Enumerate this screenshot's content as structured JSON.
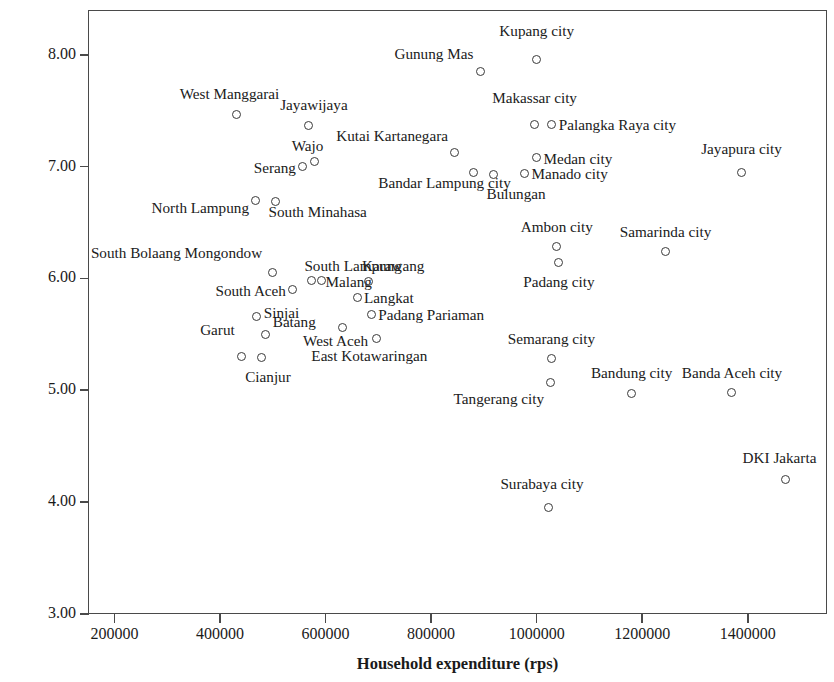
{
  "chart_data": {
    "type": "scatter",
    "title": "",
    "xlabel": "Household expenditure (rps)",
    "ylabel": "Clientelism perception index",
    "xlim": [
      150000,
      1550000
    ],
    "ylim": [
      3.0,
      8.4
    ],
    "xticks": [
      "200000",
      "400000",
      "600000",
      "800000",
      "1000000",
      "1200000",
      "1400000"
    ],
    "xtick_values": [
      200000,
      400000,
      600000,
      800000,
      1000000,
      1200000,
      1400000
    ],
    "yticks": [
      "3.00",
      "4.00",
      "5.00",
      "6.00",
      "7.00",
      "8.00"
    ],
    "ytick_values": [
      3.0,
      4.0,
      5.0,
      6.0,
      7.0,
      8.0
    ],
    "grid": false,
    "legend": "none",
    "marker": "open-circle",
    "points": [
      {
        "label": "Kupang city",
        "x": 1000000,
        "y": 7.96,
        "lx": 1000000,
        "ly": 8.22,
        "anchor": "mid"
      },
      {
        "label": "Gunung Mas",
        "x": 893000,
        "y": 7.85,
        "lx": 880000,
        "ly": 8.02,
        "anchor": "end"
      },
      {
        "label": "Makassar city",
        "x": 996000,
        "y": 7.38,
        "lx": 996000,
        "ly": 7.62,
        "anchor": "mid"
      },
      {
        "label": "Palangka Raya city",
        "x": 1029000,
        "y": 7.38,
        "lx": 1042000,
        "ly": 7.38,
        "anchor": "start"
      },
      {
        "label": "West Manggarai",
        "x": 431000,
        "y": 7.47,
        "lx": 418000,
        "ly": 7.66,
        "anchor": "mid"
      },
      {
        "label": "Jayawijaya",
        "x": 567000,
        "y": 7.37,
        "lx": 578000,
        "ly": 7.56,
        "anchor": "mid"
      },
      {
        "label": "Kutai Kartanegara",
        "x": 845000,
        "y": 7.13,
        "lx": 832000,
        "ly": 7.28,
        "anchor": "end"
      },
      {
        "label": "Wajo",
        "x": 579000,
        "y": 7.05,
        "lx": 566000,
        "ly": 7.19,
        "anchor": "mid"
      },
      {
        "label": "Serang",
        "x": 557000,
        "y": 7.0,
        "lx": 544000,
        "ly": 7.0,
        "anchor": "end"
      },
      {
        "label": "Medan city",
        "x": 1000000,
        "y": 7.08,
        "lx": 1013000,
        "ly": 7.08,
        "anchor": "start"
      },
      {
        "label": "Jayapura city",
        "x": 1388000,
        "y": 6.95,
        "lx": 1388000,
        "ly": 7.17,
        "anchor": "mid"
      },
      {
        "label": "Bandar Lampung city",
        "x": 881000,
        "y": 6.95,
        "lx": 700000,
        "ly": 6.86,
        "anchor": "start"
      },
      {
        "label": "Manado city",
        "x": 977000,
        "y": 6.94,
        "lx": 990000,
        "ly": 6.94,
        "anchor": "start"
      },
      {
        "label": "Bulungan",
        "x": 918000,
        "y": 6.93,
        "lx": 905000,
        "ly": 6.76,
        "anchor": "start"
      },
      {
        "label": "North Lampung",
        "x": 468000,
        "y": 6.7,
        "lx": 455000,
        "ly": 6.64,
        "anchor": "end"
      },
      {
        "label": "South Minahasa",
        "x": 505000,
        "y": 6.69,
        "lx": 492000,
        "ly": 6.6,
        "anchor": "start"
      },
      {
        "label": "Ambon city",
        "x": 1038000,
        "y": 6.29,
        "lx": 1038000,
        "ly": 6.47,
        "anchor": "mid"
      },
      {
        "label": "Samarinda city",
        "x": 1244000,
        "y": 6.24,
        "lx": 1244000,
        "ly": 6.42,
        "anchor": "mid"
      },
      {
        "label": "Padang city",
        "x": 1042000,
        "y": 6.14,
        "lx": 1042000,
        "ly": 5.98,
        "anchor": "mid"
      },
      {
        "label": "South Bolaang Mongondow",
        "x": 500000,
        "y": 6.05,
        "lx": 480000,
        "ly": 6.24,
        "anchor": "end"
      },
      {
        "label": "South Lampung",
        "x": 573000,
        "y": 5.98,
        "lx": 560000,
        "ly": 6.12,
        "anchor": "start"
      },
      {
        "label": "Karawang",
        "x": 682000,
        "y": 5.97,
        "lx": 669000,
        "ly": 6.12,
        "anchor": "start"
      },
      {
        "label": "Malang",
        "x": 592000,
        "y": 5.98,
        "lx": 600000,
        "ly": 5.98,
        "anchor": "start"
      },
      {
        "label": "South Aceh",
        "x": 538000,
        "y": 5.9,
        "lx": 525000,
        "ly": 5.9,
        "anchor": "end"
      },
      {
        "label": "Langkat",
        "x": 660000,
        "y": 5.83,
        "lx": 673000,
        "ly": 5.83,
        "anchor": "start"
      },
      {
        "label": "Sinjai",
        "x": 470000,
        "y": 5.66,
        "lx": 483000,
        "ly": 5.7,
        "anchor": "start"
      },
      {
        "label": "Padang Pariaman",
        "x": 687000,
        "y": 5.68,
        "lx": 700000,
        "ly": 5.68,
        "anchor": "start"
      },
      {
        "label": "Batang",
        "x": 487000,
        "y": 5.5,
        "lx": 500000,
        "ly": 5.62,
        "anchor": "start"
      },
      {
        "label": "Garut",
        "x": 440000,
        "y": 5.3,
        "lx": 428000,
        "ly": 5.55,
        "anchor": "end"
      },
      {
        "label": "West Aceh",
        "x": 632000,
        "y": 5.56,
        "lx": 619000,
        "ly": 5.45,
        "anchor": "mid"
      },
      {
        "label": "East Kotawaringan",
        "x": 696000,
        "y": 5.46,
        "lx": 683000,
        "ly": 5.32,
        "anchor": "mid"
      },
      {
        "label": "Cianjur",
        "x": 478000,
        "y": 5.29,
        "lx": 491000,
        "ly": 5.13,
        "anchor": "mid"
      },
      {
        "label": "Semarang city",
        "x": 1028000,
        "y": 5.28,
        "lx": 1028000,
        "ly": 5.47,
        "anchor": "mid"
      },
      {
        "label": "Tangerang city",
        "x": 1026000,
        "y": 5.07,
        "lx": 1014000,
        "ly": 4.93,
        "anchor": "end"
      },
      {
        "label": "Bandung city",
        "x": 1180000,
        "y": 4.97,
        "lx": 1180000,
        "ly": 5.16,
        "anchor": "mid"
      },
      {
        "label": "Banda Aceh city",
        "x": 1370000,
        "y": 4.98,
        "lx": 1370000,
        "ly": 5.16,
        "anchor": "mid"
      },
      {
        "label": "DKI Jakarta",
        "x": 1472000,
        "y": 4.2,
        "lx": 1460000,
        "ly": 4.4,
        "anchor": "mid"
      },
      {
        "label": "Surabaya city",
        "x": 1023000,
        "y": 3.95,
        "lx": 1010000,
        "ly": 4.17,
        "anchor": "mid"
      }
    ]
  }
}
